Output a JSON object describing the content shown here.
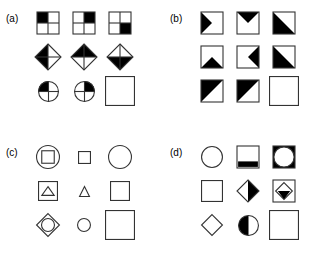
{
  "figure": {
    "background_color": "#ffffff",
    "stroke_color": "#333333",
    "fill_color": "#000000",
    "panels": [
      {
        "id": "a",
        "label": "(a)",
        "cells": [
          {
            "name": "grid-square-top-left-black",
            "shape": "quad-square",
            "filled": "tl",
            "size": 22
          },
          {
            "name": "grid-square-top-right-black",
            "shape": "quad-square",
            "filled": "tr",
            "size": 22
          },
          {
            "name": "grid-square-bottom-right-black",
            "shape": "quad-square",
            "filled": "br",
            "size": 22
          },
          {
            "name": "diamond-left-black",
            "shape": "quad-diamond",
            "filled": "left",
            "size": 26
          },
          {
            "name": "diamond-top-black",
            "shape": "quad-diamond",
            "filled": "top",
            "size": 26
          },
          {
            "name": "diamond-bottom-black",
            "shape": "quad-diamond",
            "filled": "bottom",
            "size": 26
          },
          {
            "name": "circle-top-left-black",
            "shape": "quad-circle",
            "filled": "tl",
            "size": 21
          },
          {
            "name": "circle-top-right-black",
            "shape": "quad-circle",
            "filled": "tr",
            "size": 21
          },
          {
            "name": "answer-slot-empty-square",
            "shape": "empty-square",
            "filled": "none",
            "size": 30
          }
        ]
      },
      {
        "id": "b",
        "label": "(b)",
        "cells": [
          {
            "name": "square-triangle-pointing-right",
            "shape": "box-triangle",
            "filled": "right",
            "size": 22
          },
          {
            "name": "square-triangle-pointing-down",
            "shape": "box-triangle",
            "filled": "down",
            "size": 22
          },
          {
            "name": "square-half-lower-left",
            "shape": "box-half",
            "filled": "lower-left",
            "size": 22
          },
          {
            "name": "square-triangle-pointing-up",
            "shape": "box-triangle",
            "filled": "up",
            "size": 22
          },
          {
            "name": "square-triangle-pointing-left",
            "shape": "box-triangle",
            "filled": "left",
            "size": 22
          },
          {
            "name": "square-half-lower-left-2",
            "shape": "box-half",
            "filled": "lower-left",
            "size": 22
          },
          {
            "name": "square-half-upper-left",
            "shape": "box-half",
            "filled": "upper-left",
            "size": 22
          },
          {
            "name": "square-half-upper-left-2",
            "shape": "box-half",
            "filled": "upper-left",
            "size": 22
          },
          {
            "name": "answer-slot-empty-square",
            "shape": "empty-square",
            "filled": "none",
            "size": 30
          }
        ]
      },
      {
        "id": "c",
        "label": "(c)",
        "cells": [
          {
            "name": "circle-containing-square",
            "shape": "circle-in-square-nested",
            "filled": "none",
            "size": 24
          },
          {
            "name": "small-square",
            "shape": "outline-square",
            "filled": "none",
            "size": 13
          },
          {
            "name": "large-circle",
            "shape": "outline-circle",
            "filled": "none",
            "size": 24
          },
          {
            "name": "square-containing-triangle",
            "shape": "triangle-in-square-nested",
            "filled": "none",
            "size": 20
          },
          {
            "name": "small-triangle",
            "shape": "outline-triangle",
            "filled": "none",
            "size": 11
          },
          {
            "name": "medium-square",
            "shape": "outline-square",
            "filled": "none",
            "size": 20
          },
          {
            "name": "diamond-containing-circle",
            "shape": "circle-in-diamond-nested",
            "filled": "none",
            "size": 24
          },
          {
            "name": "small-circle",
            "shape": "outline-circle",
            "filled": "none",
            "size": 14
          },
          {
            "name": "answer-slot-empty-square",
            "shape": "empty-square",
            "filled": "none",
            "size": 30
          }
        ]
      },
      {
        "id": "d",
        "label": "(d)",
        "cells": [
          {
            "name": "plain-circle",
            "shape": "outline-circle",
            "filled": "none",
            "size": 22
          },
          {
            "name": "square-black-bottom-band",
            "shape": "square-band",
            "filled": "bottom",
            "size": 22
          },
          {
            "name": "square-with-circle-notch",
            "shape": "square-circle-notch",
            "filled": "corners",
            "size": 22
          },
          {
            "name": "plain-square",
            "shape": "outline-square",
            "filled": "none",
            "size": 22
          },
          {
            "name": "diamond-right-half-black",
            "shape": "diamond-half",
            "filled": "right",
            "size": 22
          },
          {
            "name": "square-diamond-black-wedge",
            "shape": "diamond-in-square-wedge",
            "filled": "bottom",
            "size": 22
          },
          {
            "name": "plain-diamond",
            "shape": "outline-diamond",
            "filled": "none",
            "size": 22
          },
          {
            "name": "circle-left-half-black",
            "shape": "circle-half",
            "filled": "left",
            "size": 21
          },
          {
            "name": "answer-slot-empty-square",
            "shape": "empty-square",
            "filled": "none",
            "size": 30
          }
        ]
      }
    ]
  }
}
